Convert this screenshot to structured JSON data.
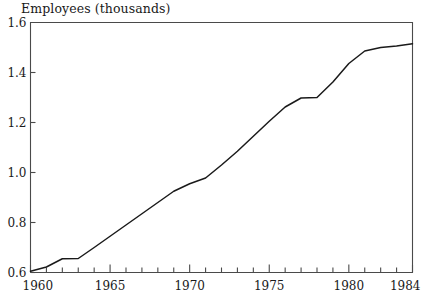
{
  "chart_data": {
    "type": "line",
    "title": "Employees (thousands)",
    "xlabel": "",
    "ylabel": "",
    "x": [
      1960,
      1961,
      1962,
      1963,
      1964,
      1965,
      1966,
      1967,
      1968,
      1969,
      1970,
      1971,
      1972,
      1973,
      1974,
      1975,
      1976,
      1977,
      1978,
      1979,
      1980,
      1981,
      1982,
      1983,
      1984
    ],
    "values": [
      0.605,
      0.622,
      0.655,
      0.656,
      0.7,
      0.745,
      0.79,
      0.835,
      0.88,
      0.925,
      0.955,
      0.978,
      1.03,
      1.085,
      1.145,
      1.205,
      1.262,
      1.298,
      1.3,
      1.362,
      1.436,
      1.486,
      1.5,
      1.506,
      1.515
    ],
    "series": [
      {
        "name": "Employees",
        "values": [
          0.605,
          0.622,
          0.655,
          0.656,
          0.7,
          0.745,
          0.79,
          0.835,
          0.88,
          0.925,
          0.955,
          0.978,
          1.03,
          1.085,
          1.145,
          1.205,
          1.262,
          1.298,
          1.3,
          1.362,
          1.436,
          1.486,
          1.5,
          1.506,
          1.515
        ]
      }
    ],
    "xlim": [
      1960,
      1984
    ],
    "ylim": [
      0.6,
      1.6
    ],
    "ytick_labels": [
      "0.6",
      "0.8",
      "1.0",
      "1.2",
      "1.4",
      "1.6"
    ],
    "ytick_values": [
      0.6,
      0.8,
      1.0,
      1.2,
      1.4,
      1.6
    ],
    "xtick_labels": [
      "1960",
      "1965",
      "1970",
      "1975",
      "1980",
      "1984"
    ],
    "xtick_values": [
      1960,
      1965,
      1970,
      1975,
      1980,
      1984
    ],
    "xtick_minor_step": 1,
    "grid": false,
    "legend": false,
    "line_color": "#1a1a1a",
    "axis_color": "#4a4a4a",
    "background": "#ffffff"
  }
}
